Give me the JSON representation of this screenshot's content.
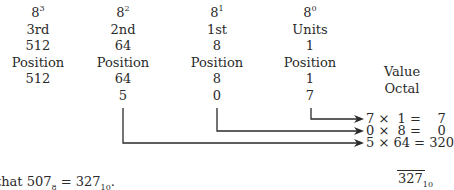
{
  "columns": [
    {
      "base": "8",
      "exp": "3",
      "ordinal": "3rd",
      "weight": "512",
      "label": "Position",
      "value": "512",
      "digit": "5"
    },
    {
      "base": "8",
      "exp": "2",
      "ordinal": "2nd",
      "weight": "64",
      "label": "Position",
      "value": "64",
      "digit": "5"
    },
    {
      "base": "8",
      "exp": "1",
      "ordinal": "1st",
      "weight": "8",
      "label": "Position",
      "value": "8",
      "digit": "0"
    },
    {
      "base": "8",
      "exp": "0",
      "ordinal": "Units",
      "weight": "1",
      "label": "Position",
      "value": "1",
      "digit": "7"
    }
  ],
  "side_labels": {
    "value": "Value",
    "octal": "Octal"
  },
  "equations": [
    {
      "text": "7 ×  1 =    7"
    },
    {
      "text": "0 ×  8 =    0"
    },
    {
      "text": "5 × 64 = 320"
    }
  ],
  "total": {
    "value": "327",
    "base": "10"
  },
  "note": {
    "prefix": "that 507",
    "base8": "8",
    "mid": " =  327",
    "base10": "10",
    "end": "."
  }
}
